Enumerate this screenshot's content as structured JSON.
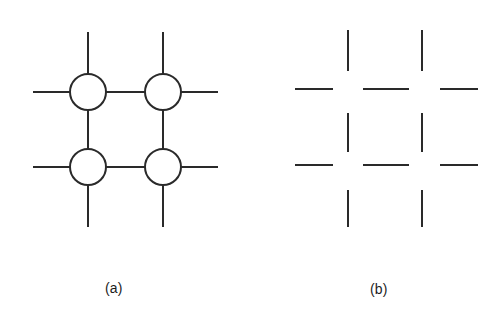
{
  "figure": {
    "background_color": "#ffffff",
    "stroke_color": "#2a2a2a",
    "stroke_width": 2,
    "panels": [
      {
        "id": "panel-a",
        "caption": "(a)",
        "caption_position": {
          "x": 105,
          "y": 280
        },
        "description": "Two-by-two lattice of open circles joined by straight line segments, with free line stubs extending outward at top, bottom, left and right",
        "circle_radius": 18,
        "circles": [
          {
            "name": "node-top-left",
            "cx": 88,
            "cy": 92
          },
          {
            "name": "node-top-right",
            "cx": 163,
            "cy": 92
          },
          {
            "name": "node-bottom-left",
            "cx": 88,
            "cy": 167
          },
          {
            "name": "node-bottom-right",
            "cx": 163,
            "cy": 167
          }
        ],
        "segments": [
          {
            "name": "stub-top-left-up",
            "x1": 88,
            "y1": 32,
            "x2": 88,
            "y2": 74
          },
          {
            "name": "stub-top-right-up",
            "x1": 163,
            "y1": 32,
            "x2": 163,
            "y2": 74
          },
          {
            "name": "stub-left-top-out",
            "x1": 33,
            "y1": 92,
            "x2": 70,
            "y2": 92
          },
          {
            "name": "stub-right-top-out",
            "x1": 181,
            "y1": 92,
            "x2": 218,
            "y2": 92
          },
          {
            "name": "link-top-horizontal",
            "x1": 106,
            "y1": 92,
            "x2": 145,
            "y2": 92
          },
          {
            "name": "link-left-vertical",
            "x1": 88,
            "y1": 110,
            "x2": 88,
            "y2": 149
          },
          {
            "name": "link-right-vertical",
            "x1": 163,
            "y1": 110,
            "x2": 163,
            "y2": 149
          },
          {
            "name": "stub-left-bottom-out",
            "x1": 33,
            "y1": 167,
            "x2": 70,
            "y2": 167
          },
          {
            "name": "stub-right-bottom-out",
            "x1": 181,
            "y1": 167,
            "x2": 218,
            "y2": 167
          },
          {
            "name": "link-bottom-horizontal",
            "x1": 106,
            "y1": 167,
            "x2": 145,
            "y2": 167
          },
          {
            "name": "stub-bottom-left-down",
            "x1": 88,
            "y1": 185,
            "x2": 88,
            "y2": 227
          },
          {
            "name": "stub-bottom-right-down",
            "x1": 163,
            "y1": 185,
            "x2": 163,
            "y2": 227
          }
        ]
      },
      {
        "id": "panel-b",
        "caption": "(b)",
        "caption_position": {
          "x": 370,
          "y": 281
        },
        "description": "Same lattice with the circular nodes removed, leaving only the broken grid line segments and gaps at the crossing points",
        "circle_radius": 0,
        "circles": [],
        "segments": [
          {
            "name": "vertical-left-top",
            "x1": 348,
            "y1": 30,
            "x2": 348,
            "y2": 71
          },
          {
            "name": "vertical-right-top",
            "x1": 422,
            "y1": 30,
            "x2": 422,
            "y2": 71
          },
          {
            "name": "horizontal-top-left",
            "x1": 295,
            "y1": 89,
            "x2": 333,
            "y2": 89
          },
          {
            "name": "horizontal-top-middle",
            "x1": 363,
            "y1": 89,
            "x2": 409,
            "y2": 89
          },
          {
            "name": "horizontal-top-right",
            "x1": 440,
            "y1": 89,
            "x2": 478,
            "y2": 89
          },
          {
            "name": "vertical-left-middle",
            "x1": 348,
            "y1": 113,
            "x2": 348,
            "y2": 152
          },
          {
            "name": "vertical-right-middle",
            "x1": 422,
            "y1": 113,
            "x2": 422,
            "y2": 152
          },
          {
            "name": "horizontal-bottom-left",
            "x1": 295,
            "y1": 165,
            "x2": 333,
            "y2": 165
          },
          {
            "name": "horizontal-bottom-middle",
            "x1": 363,
            "y1": 165,
            "x2": 409,
            "y2": 165
          },
          {
            "name": "horizontal-bottom-right",
            "x1": 440,
            "y1": 165,
            "x2": 478,
            "y2": 165
          },
          {
            "name": "vertical-left-bottom",
            "x1": 348,
            "y1": 190,
            "x2": 348,
            "y2": 227
          },
          {
            "name": "vertical-right-bottom",
            "x1": 422,
            "y1": 190,
            "x2": 422,
            "y2": 227
          }
        ]
      }
    ]
  }
}
